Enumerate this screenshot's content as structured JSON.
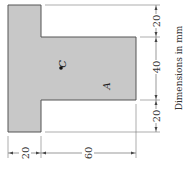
{
  "figure": {
    "shape": "T-section (rotated)",
    "fill_color": "#c8c8c8",
    "edge_color": "#555555",
    "labels": {
      "centroid": "C",
      "axis_point": "A"
    },
    "dimensions_right": [
      "20",
      "40",
      "20"
    ],
    "dimensions_bottom": [
      "20",
      "60"
    ],
    "units_note": "Dimensions in mm"
  }
}
